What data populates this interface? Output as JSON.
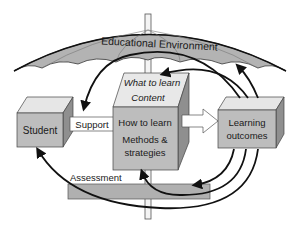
{
  "title": "Educational Environment",
  "nodes": {
    "student": "Student",
    "support": "Support",
    "what_to_learn": "What to learn",
    "content": "Content",
    "how_to_learn": "How to learn",
    "methods_1": "Methods &",
    "methods_2": "strategies",
    "learning_1": "Learning",
    "learning_2": "outcomes",
    "assessment": "Assessment"
  },
  "colors": {
    "umbrella": "#b3b3b3",
    "box_front": "#bdbdbd",
    "box_side": "#8f8f8f",
    "box_top": "#e6e6e6",
    "arrow": "#111111"
  }
}
